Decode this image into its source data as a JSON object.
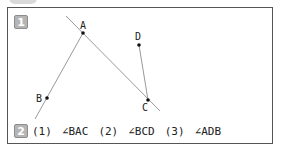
{
  "figure": {
    "badge_1": "1",
    "badge_2": "2",
    "points": {
      "A": {
        "label": "A",
        "x": 83,
        "y": 33
      },
      "B": {
        "label": "B",
        "x": 47,
        "y": 98
      },
      "C": {
        "label": "C",
        "x": 148,
        "y": 100
      },
      "D": {
        "label": "D",
        "x": 139,
        "y": 45
      }
    },
    "colors": {
      "frame": "#555555",
      "badge": "#b5b5b5",
      "line": "#9a9a9a",
      "point": "#111111"
    }
  },
  "questions": [
    {
      "number": "(1)",
      "angle": "∠BAC"
    },
    {
      "number": "(2)",
      "angle": "∠BCD"
    },
    {
      "number": "(3)",
      "angle": "∠ADB"
    }
  ]
}
